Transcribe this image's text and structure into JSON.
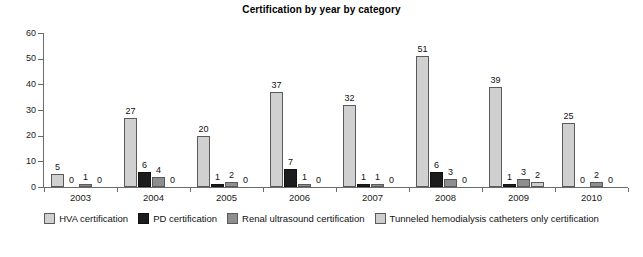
{
  "chart_data": {
    "type": "bar",
    "title": "Certification by year by category",
    "xlabel": "",
    "ylabel": "",
    "ylim": [
      0,
      60
    ],
    "yticks": [
      0,
      10,
      20,
      30,
      40,
      50,
      60
    ],
    "grid": false,
    "legend_position": "bottom",
    "categories": [
      "2003",
      "2004",
      "2005",
      "2006",
      "2007",
      "2008",
      "2009",
      "2010"
    ],
    "series": [
      {
        "name": "HVA certification",
        "color": "#d0d0d0",
        "values": [
          5,
          27,
          20,
          37,
          32,
          51,
          39,
          25
        ]
      },
      {
        "name": "PD certification",
        "color": "#1c1c1c",
        "values": [
          0,
          6,
          1,
          7,
          1,
          6,
          1,
          0
        ]
      },
      {
        "name": "Renal ultrasound certification",
        "color": "#8e8e8e",
        "values": [
          1,
          4,
          2,
          1,
          1,
          3,
          3,
          2
        ]
      },
      {
        "name": "Tunneled hemodialysis catheters only certification",
        "color": "#cdcdcd",
        "values": [
          0,
          0,
          0,
          0,
          0,
          0,
          2,
          0
        ]
      }
    ]
  }
}
